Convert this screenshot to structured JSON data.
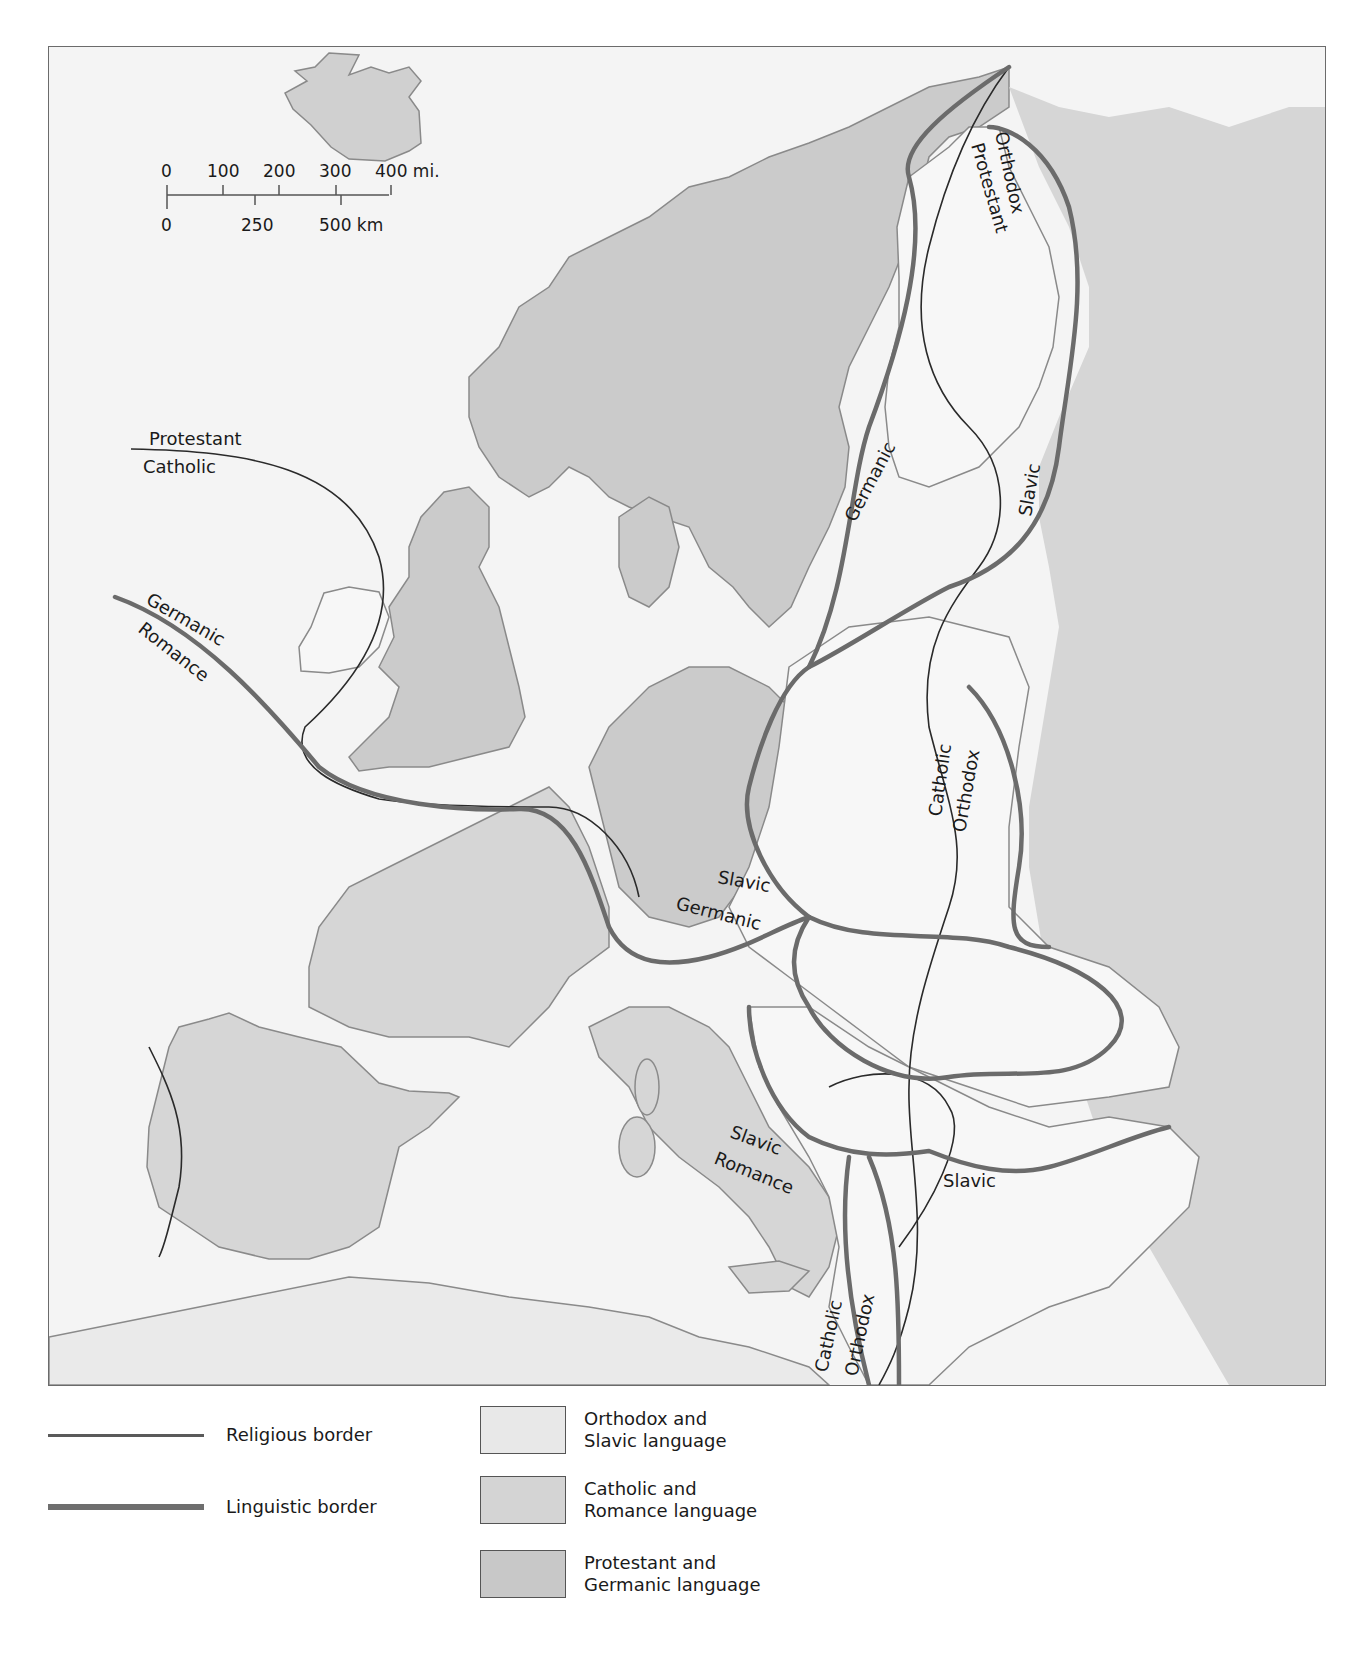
{
  "map": {
    "scale_bar": {
      "miles_ticks": [
        "0",
        "100",
        "200",
        "300",
        "400 mi."
      ],
      "km_ticks": [
        "0",
        "250",
        "500 km"
      ]
    },
    "labels": {
      "protestant_west": "Protestant",
      "catholic_west": "Catholic",
      "germanic_west": "Germanic",
      "romance_west": "Romance",
      "orthodox_north": "Orthodox",
      "protestant_north": "Protestant",
      "germanic_baltic": "Germanic",
      "slavic_baltic": "Slavic",
      "catholic_east": "Catholic",
      "orthodox_east": "Orthodox",
      "slavic_central": "Slavic",
      "germanic_central": "Germanic",
      "slavic_adriatic": "Slavic",
      "romance_adriatic": "Romance",
      "slavic_balkan": "Slavic",
      "catholic_south": "Catholic",
      "orthodox_south": "Orthodox"
    },
    "colors": {
      "sea": "#f4f4f4",
      "orthodox_slavic": "#f7f7f7",
      "catholic_romance": "#d6d6d6",
      "protestant_germanic": "#cbcbcb",
      "coast": "#8a8a8a",
      "religious_border": "#2a2a2a",
      "linguistic_border": "#6b6b6b"
    }
  },
  "legend": {
    "lines": [
      {
        "label": "Religious border"
      },
      {
        "label": "Linguistic border"
      }
    ],
    "areas": [
      {
        "line1": "Orthodox and",
        "line2": "Slavic language",
        "color": "#e8e8e8"
      },
      {
        "line1": "Catholic and",
        "line2": "Romance language",
        "color": "#d4d4d4"
      },
      {
        "line1": "Protestant and",
        "line2": "Germanic language",
        "color": "#c8c8c8"
      }
    ]
  }
}
